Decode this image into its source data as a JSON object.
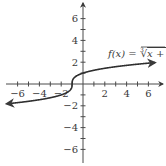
{
  "chart_data": {
    "type": "line",
    "title": "",
    "function_label": "f(x) = ∛(x + 1)",
    "function_label_parts": {
      "lhs": "f(x) = ",
      "index": "3",
      "radicand": "x + 1"
    },
    "xlabel": "",
    "ylabel": "",
    "xlim": [
      -7,
      7
    ],
    "ylim": [
      -7,
      7
    ],
    "x_ticks": [
      -6,
      -5,
      -4,
      -3,
      -2,
      -1,
      1,
      2,
      3,
      4,
      5,
      6
    ],
    "x_tick_labels": [
      "-6",
      "-4",
      "-2",
      "2",
      "4",
      "6"
    ],
    "x_tick_label_values": [
      -6,
      -4,
      -2,
      2,
      4,
      6
    ],
    "y_ticks": [
      -6,
      -5,
      -4,
      -3,
      -2,
      -1,
      1,
      2,
      3,
      4,
      5,
      6
    ],
    "y_tick_labels": [
      "6",
      "4",
      "2",
      "-2",
      "-4",
      "-6"
    ],
    "y_tick_label_values": [
      6,
      4,
      2,
      -2,
      -4,
      -6
    ],
    "grid": false,
    "legend": "none",
    "series": [
      {
        "name": "f(x) = cube root of (x + 1)",
        "x": [
          -7,
          -6,
          -5,
          -4,
          -3,
          -2,
          -1.5,
          -1,
          -0.5,
          0,
          1,
          2,
          3,
          4,
          5,
          6,
          6.6
        ],
        "values": [
          -1.82,
          -1.71,
          -1.59,
          -1.44,
          -1.26,
          -1.0,
          -0.79,
          0,
          0.79,
          1.0,
          1.26,
          1.44,
          1.59,
          1.71,
          1.82,
          1.91,
          1.97
        ]
      }
    ],
    "colors": {
      "axis": "#4a4a4a",
      "curve": "#2f2f2f",
      "text": "#3a3a3a"
    }
  }
}
